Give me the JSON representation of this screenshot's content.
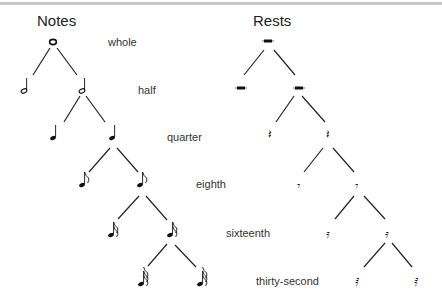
{
  "titles": {
    "notes": "Notes",
    "rests": "Rests"
  },
  "levels": [
    {
      "label": "whole",
      "count": 1
    },
    {
      "label": "half",
      "count": 2
    },
    {
      "label": "quarter",
      "count": 2
    },
    {
      "label": "eighth",
      "count": 2
    },
    {
      "label": "sixteenth",
      "count": 2
    },
    {
      "label": "thirty-second",
      "count": 2
    }
  ],
  "colors": {
    "ink": "#111111",
    "border": "#c8c8c8"
  }
}
